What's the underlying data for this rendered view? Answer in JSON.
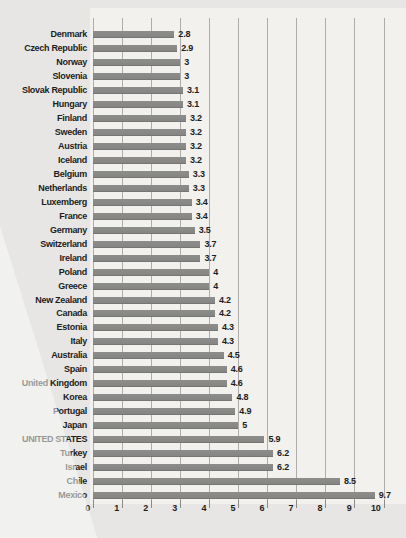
{
  "page": {
    "background_color": "#e7e6e4",
    "plot_background_color": "#f2f1ee"
  },
  "chart_data": {
    "type": "bar",
    "orientation": "horizontal",
    "title": "",
    "xlabel": "",
    "ylabel": "",
    "categories": [
      "Denmark",
      "Czech Republic",
      "Norway",
      "Slovenia",
      "Slovak Republic",
      "Hungary",
      "Finland",
      "Sweden",
      "Austria",
      "Iceland",
      "Belgium",
      "Netherlands",
      "Luxemberg",
      "France",
      "Germany",
      "Switzerland",
      "Ireland",
      "Poland",
      "Greece",
      "New Zealand",
      "Canada",
      "Estonia",
      "Italy",
      "Australia",
      "Spain",
      "United Kingdom",
      "Korea",
      "Portugal",
      "Japan",
      "UNITED STATES",
      "Turkey",
      "Israel",
      "Chile",
      "Mexico"
    ],
    "values": [
      2.8,
      2.9,
      3,
      3,
      3.1,
      3.1,
      3.2,
      3.2,
      3.2,
      3.2,
      3.3,
      3.3,
      3.4,
      3.4,
      3.5,
      3.7,
      3.7,
      4,
      4,
      4.2,
      4.2,
      4.3,
      4.3,
      4.5,
      4.6,
      4.6,
      4.8,
      4.9,
      5,
      5.9,
      6.2,
      6.2,
      8.5,
      9.7
    ],
    "highlight_category": "UNITED STATES",
    "xlim": [
      0,
      10
    ],
    "x_ticks": [
      0,
      1,
      2,
      3,
      4,
      5,
      6,
      7,
      8,
      9,
      10
    ],
    "grid": true,
    "legend": false,
    "bar_color": "#8d8d8b",
    "gridline_color": "#aeadab",
    "text_color": "#1d1d1d"
  }
}
